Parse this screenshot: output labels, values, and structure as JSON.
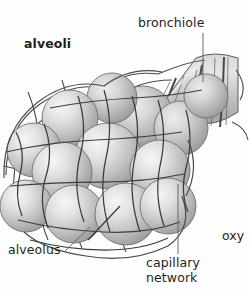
{
  "figure": {
    "background_color": "#fefefe",
    "ink_color": "#231f20",
    "line_color": "#4a4a4a",
    "capillary_color": "#3a3a3a",
    "sphere_highlight": "#f2f2f2",
    "sphere_midtone": "#c9c9c9",
    "sphere_shadow": "#9a9a9a",
    "tube_fill": "#bfbfbf"
  },
  "labels": {
    "alveoli": "alveoli",
    "bronchiole": "bronchiole",
    "alveolus": "alveolus",
    "capillary_line1": "capillary",
    "capillary_line2": "network",
    "oxygen_clipped": "oxy"
  },
  "structures": {
    "alveoli_cluster_count": 13,
    "bronchiole_ring_count": 8,
    "leaders": [
      {
        "name": "bronchiole-leader",
        "type": "vertical-line"
      },
      {
        "name": "alveolus-leader",
        "type": "diagonal-line"
      },
      {
        "name": "capillary-network-leader",
        "type": "vertical-line"
      }
    ]
  }
}
